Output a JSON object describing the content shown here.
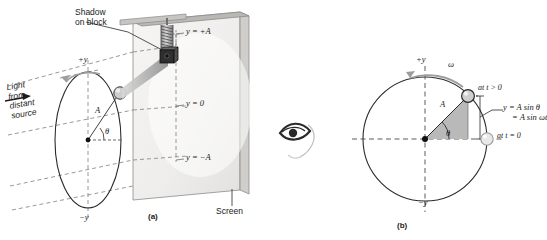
{
  "figure": {
    "panels": [
      {
        "id": "a",
        "caption": "(a)",
        "labels": {
          "shadow": "Shadow\non block",
          "shadow_line1": "Shadow",
          "shadow_line2": "on block",
          "light_line1": "Light",
          "light_line2": "from",
          "light_line3": "distant",
          "light_line4": "source",
          "screen": "Screen",
          "y_plus_a": "y = +A",
          "y_zero": "y = 0",
          "y_minus_a": "y = −A",
          "axis_plus_y": "+y",
          "axis_minus_y": "−y",
          "amplitude": "A",
          "angle": "θ"
        }
      },
      {
        "id": "b",
        "caption": "(b)",
        "labels": {
          "axis_plus_y": "+y",
          "axis_minus_y": "−y",
          "omega": "ω",
          "at_t_gt_0": "at t > 0",
          "at_t_eq_0": "at t = 0",
          "amplitude": "A",
          "angle": "θ",
          "eq_line1": "y = A sin θ",
          "eq_line2": "= A sin ωt"
        }
      }
    ],
    "observer_icon": "eye-icon",
    "colors": {
      "ink": "#1a1a1a",
      "shadow_beam": "#b4b4b4",
      "screen_face": "#f2f1ef",
      "screen_edge": "#9a9a9a",
      "block_dark": "#2b2b2b",
      "triangle_fill": "#b9b9b9",
      "ball_fill": "#c9c9c9",
      "dashed": "#7a7a7a"
    }
  }
}
